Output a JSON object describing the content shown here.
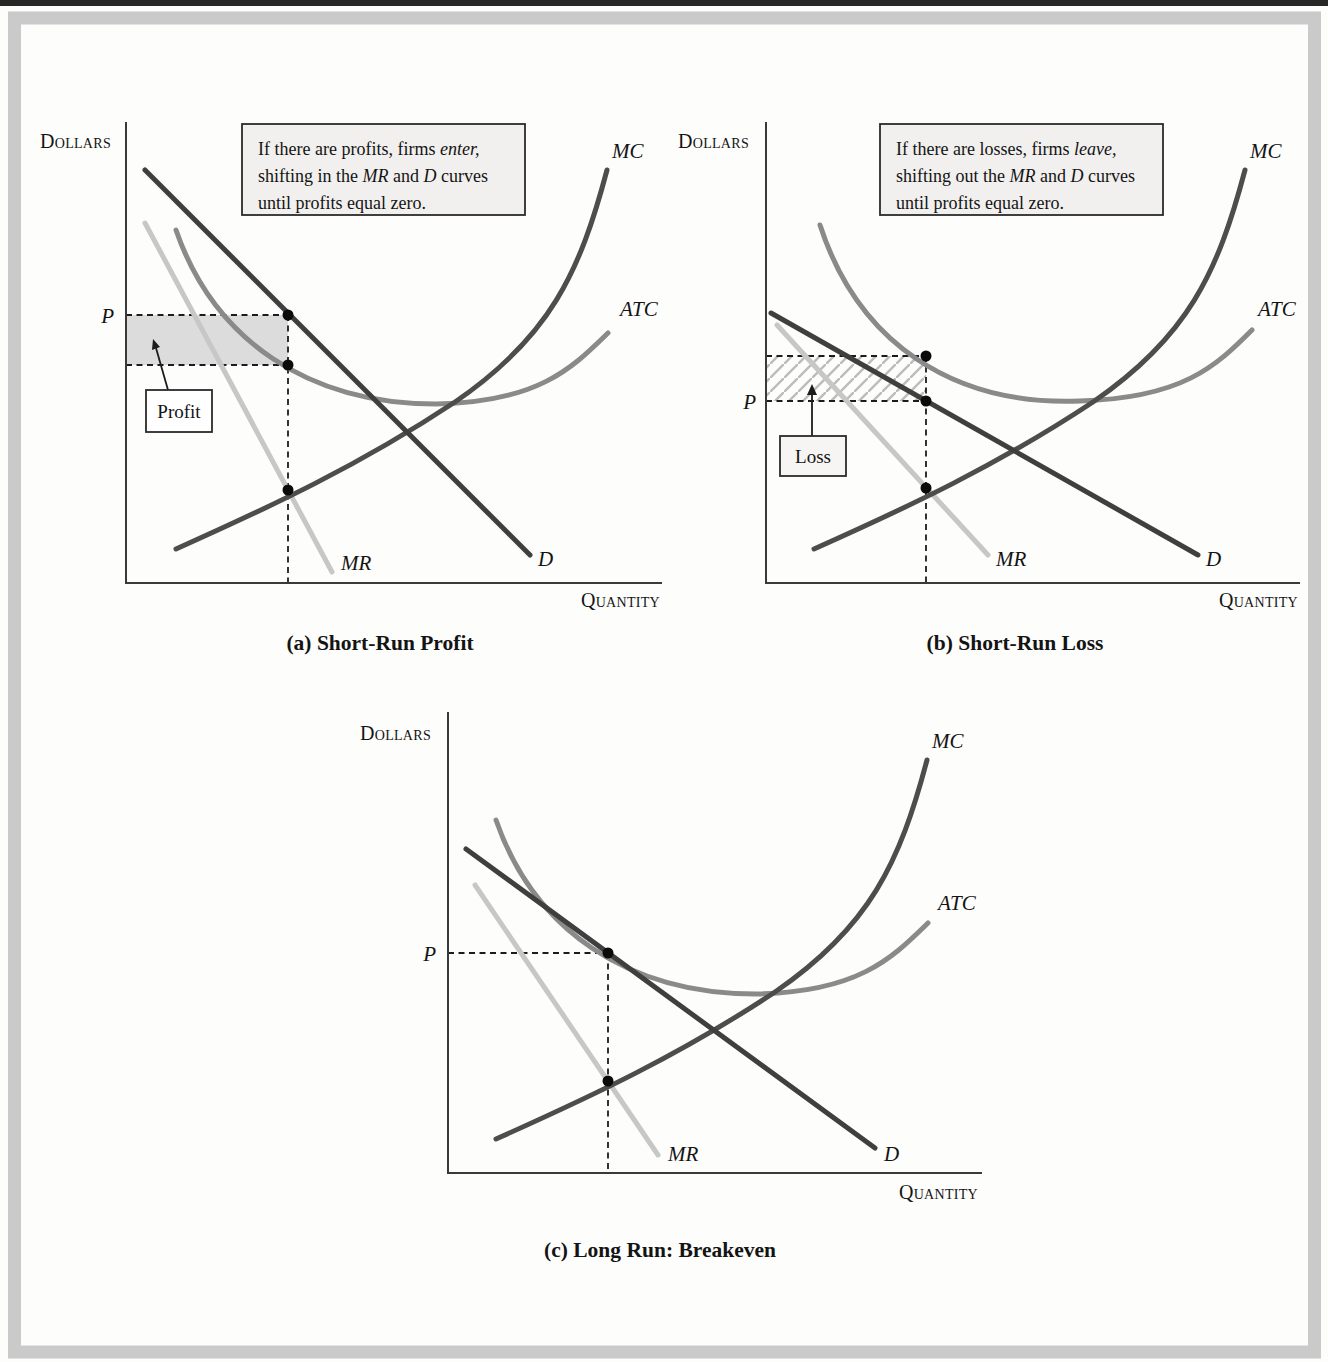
{
  "colors": {
    "curve_d": "#3f3f3f",
    "curve_mc": "#4d4d4d",
    "curve_atc": "#8a8a8a",
    "curve_mr": "#c7c7c7",
    "axis": "#3a3a3a",
    "profit_fill": "#dcdcdc",
    "note_bg": "#f1f0ee",
    "tag_bg": "#f6f5f3",
    "frame": "#cacaca",
    "top_bar": "#262626",
    "hatch": "#bdbdbd"
  },
  "panels": {
    "a": {
      "dollars": "Dollars",
      "quantity": "Quantity",
      "p": "P",
      "labels": {
        "mc": "MC",
        "atc": "ATC",
        "mr": "MR",
        "d": "D"
      },
      "region": "Profit",
      "caption": "(a) Short-Run Profit",
      "note": [
        [
          {
            "t": "If there are profits, firms "
          },
          {
            "t": "enter,",
            "i": 1
          }
        ],
        [
          {
            "t": "shifting in the "
          },
          {
            "t": "MR",
            "i": 1
          },
          {
            "t": " and "
          },
          {
            "t": "D",
            "i": 1
          },
          {
            "t": " curves"
          }
        ],
        [
          {
            "t": "until profits equal zero."
          }
        ]
      ]
    },
    "b": {
      "dollars": "Dollars",
      "quantity": "Quantity",
      "p": "P",
      "labels": {
        "mc": "MC",
        "atc": "ATC",
        "mr": "MR",
        "d": "D"
      },
      "region": "Loss",
      "caption": "(b) Short-Run Loss",
      "note": [
        [
          {
            "t": "If there are losses, firms "
          },
          {
            "t": "leave,",
            "i": 1
          }
        ],
        [
          {
            "t": "shifting out the "
          },
          {
            "t": "MR",
            "i": 1
          },
          {
            "t": " and "
          },
          {
            "t": "D",
            "i": 1
          },
          {
            "t": " curves"
          }
        ],
        [
          {
            "t": "until profits equal zero."
          }
        ]
      ]
    },
    "c": {
      "dollars": "Dollars",
      "quantity": "Quantity",
      "p": "P",
      "labels": {
        "mc": "MC",
        "atc": "ATC",
        "mr": "MR",
        "d": "D"
      },
      "caption": "(c) Long Run: Breakeven"
    }
  },
  "chart_data": [
    {
      "type": "line",
      "title": "(a) Short-Run Profit",
      "xlabel": "Quantity",
      "ylabel": "Dollars",
      "xlim": [
        0,
        100
      ],
      "ylim": [
        0,
        100
      ],
      "grid": false,
      "series": [
        {
          "name": "D",
          "points": [
            [
              4,
              90
            ],
            [
              75,
              6
            ]
          ]
        },
        {
          "name": "MR",
          "points": [
            [
              4,
              78
            ],
            [
              38,
              2
            ]
          ]
        },
        {
          "name": "MC",
          "points": [
            [
              9,
              7
            ],
            [
              30,
              20
            ],
            [
              61,
              39
            ],
            [
              78,
              61
            ],
            [
              90,
              90
            ]
          ]
        },
        {
          "name": "ATC",
          "points": [
            [
              9,
              77
            ],
            [
              30,
              48
            ],
            [
              60,
              39
            ],
            [
              75,
              41
            ],
            [
              91,
              54
            ]
          ]
        }
      ],
      "key_values": {
        "P": 58,
        "Q": 30,
        "ATC_at_Q": 48
      },
      "annotations": [
        "P",
        "Profit",
        "shaded rectangle between P and ATC from 0 to Q"
      ]
    },
    {
      "type": "line",
      "title": "(b) Short-Run Loss",
      "xlabel": "Quantity",
      "ylabel": "Dollars",
      "xlim": [
        0,
        100
      ],
      "ylim": [
        0,
        100
      ],
      "grid": false,
      "series": [
        {
          "name": "D",
          "points": [
            [
              1,
              59
            ],
            [
              81,
              6
            ]
          ]
        },
        {
          "name": "MR",
          "points": [
            [
              2,
              56
            ],
            [
              42,
              6
            ]
          ]
        },
        {
          "name": "MC",
          "points": [
            [
              9,
              7
            ],
            [
              30,
              21
            ],
            [
              61,
              39
            ],
            [
              78,
              61
            ],
            [
              90,
              90
            ]
          ]
        },
        {
          "name": "ATC",
          "points": [
            [
              9,
              78
            ],
            [
              30,
              49
            ],
            [
              60,
              40
            ],
            [
              75,
              42
            ],
            [
              91,
              55
            ]
          ]
        }
      ],
      "key_values": {
        "P": 40,
        "Q": 30,
        "ATC_at_Q": 49
      },
      "annotations": [
        "P",
        "Loss",
        "hatched rectangle between ATC and P from 0 to Q"
      ]
    },
    {
      "type": "line",
      "title": "(c) Long Run: Breakeven",
      "xlabel": "Quantity",
      "ylabel": "Dollars",
      "xlim": [
        0,
        100
      ],
      "ylim": [
        0,
        100
      ],
      "grid": false,
      "series": [
        {
          "name": "D",
          "points": [
            [
              3,
              70
            ],
            [
              80,
              5
            ]
          ]
        },
        {
          "name": "MR",
          "points": [
            [
              5,
              62
            ],
            [
              39,
              4
            ]
          ]
        },
        {
          "name": "MC",
          "points": [
            [
              9,
              7
            ],
            [
              30,
              20
            ],
            [
              61,
              39
            ],
            [
              78,
              61
            ],
            [
              90,
              90
            ]
          ]
        },
        {
          "name": "ATC",
          "points": [
            [
              9,
              77
            ],
            [
              30,
              48
            ],
            [
              60,
              39
            ],
            [
              75,
              41
            ],
            [
              91,
              54
            ]
          ]
        }
      ],
      "key_values": {
        "P": 48,
        "Q": 30,
        "ATC_at_Q": 48
      },
      "annotations": [
        "P",
        "D tangent to ATC at breakeven point, profit equals zero"
      ]
    }
  ]
}
